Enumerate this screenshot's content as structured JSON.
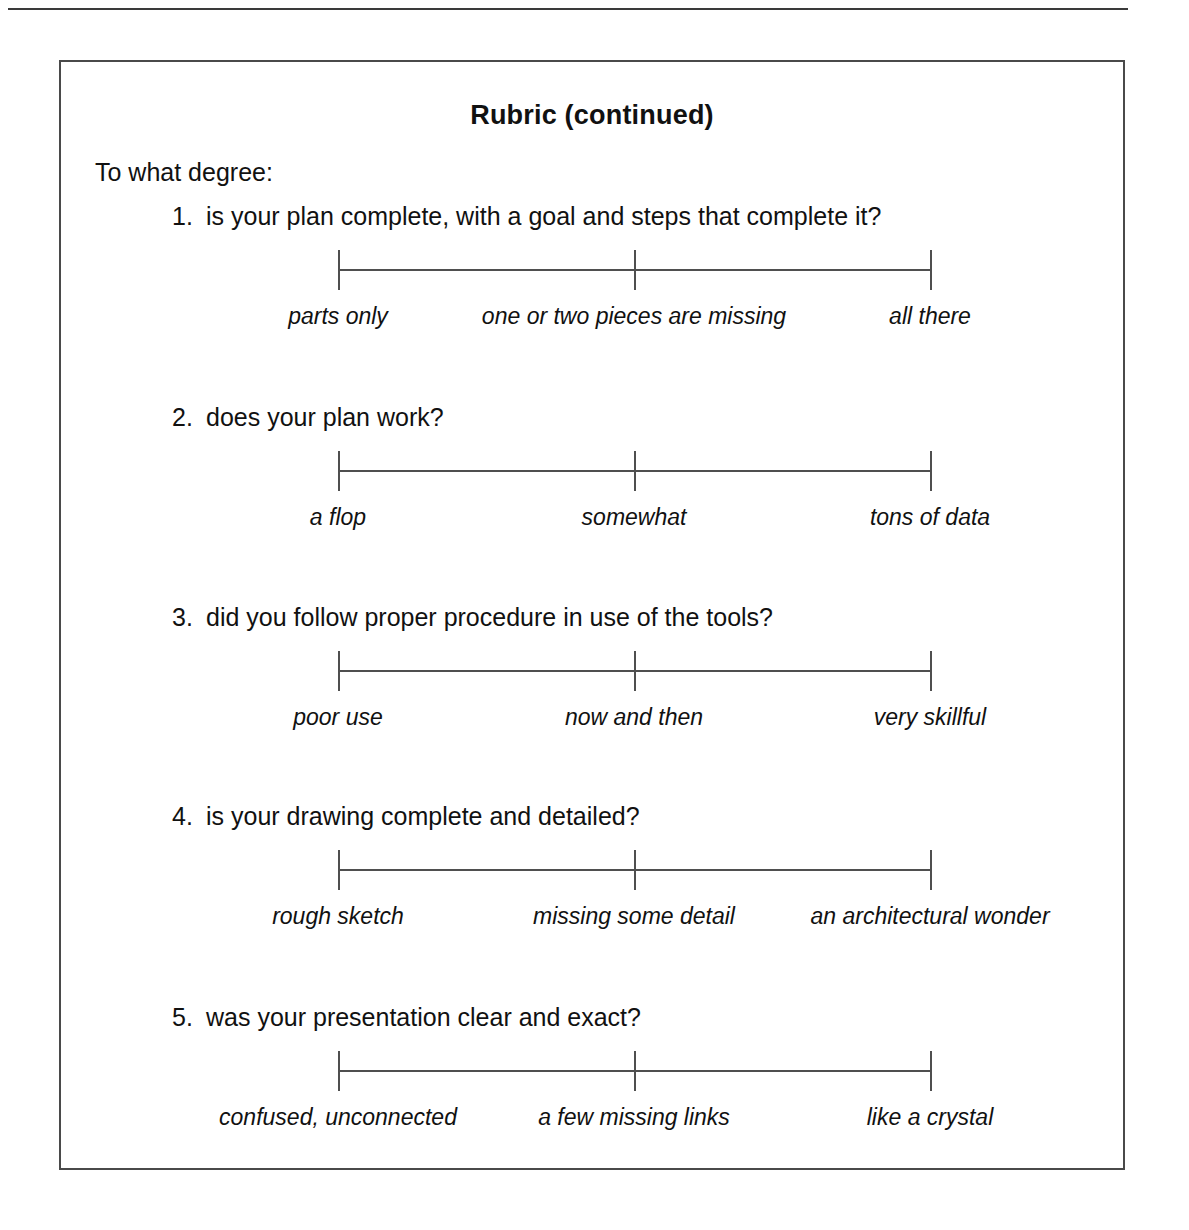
{
  "page": {
    "title": "Rubric (continued)",
    "lead_in": "To what degree:"
  },
  "items": [
    {
      "number": "1.",
      "question": "is your plan complete, with a goal and steps that complete it?",
      "anchors": {
        "left": "parts only",
        "center": "one or two pieces are missing",
        "right": "all there"
      }
    },
    {
      "number": "2.",
      "question": "does your plan work?",
      "anchors": {
        "left": "a flop",
        "center": "somewhat",
        "right": "tons of data"
      }
    },
    {
      "number": "3.",
      "question": "did you follow proper procedure in use of the tools?",
      "anchors": {
        "left": "poor use",
        "center": "now and then",
        "right": "very skillful"
      }
    },
    {
      "number": "4.",
      "question": "is your drawing complete and detailed?",
      "anchors": {
        "left": "rough sketch",
        "center": "missing some detail",
        "right": "an architectural wonder"
      }
    },
    {
      "number": "5.",
      "question": "was your presentation clear and exact?",
      "anchors": {
        "left": "confused, unconnected",
        "center": "a few missing links",
        "right": "like a crystal"
      }
    }
  ],
  "layout": {
    "item_tops": [
      140,
      341,
      541,
      740,
      941
    ]
  },
  "colors": {
    "ink": "#111111",
    "rule": "#4a4a4a",
    "background": "#ffffff"
  }
}
